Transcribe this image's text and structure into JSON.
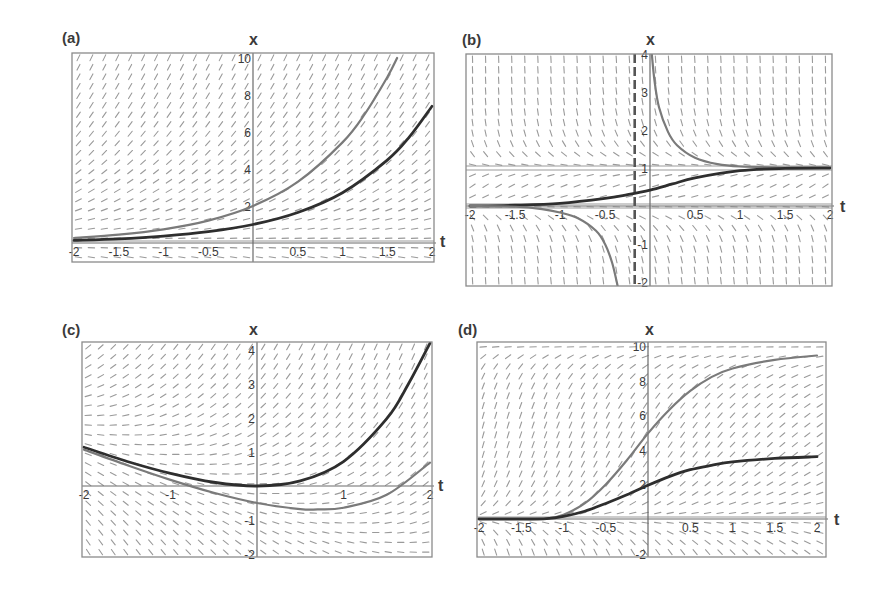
{
  "chart_data": [
    {
      "id": "a",
      "type": "line",
      "title": "(a)",
      "xlabel": "t",
      "ylabel": "x",
      "xlim": [
        -2.02,
        2.02
      ],
      "ylim": [
        -1.05,
        10.2
      ],
      "xticks": [
        -2,
        -1.5,
        -1,
        -0.5,
        0.5,
        1,
        1.5,
        2
      ],
      "xtick_labels": [
        "-2",
        "-1.5",
        "-1",
        "-0.5",
        "0.5",
        "1",
        "1.5",
        "2"
      ],
      "yticks": [
        -2,
        2,
        4,
        6,
        8,
        10
      ],
      "ytick_labels": [
        "-2",
        "2",
        "4",
        "6",
        "8",
        "10"
      ],
      "slope_field": "x",
      "equilibria": [
        0
      ],
      "series": [
        {
          "name": "x = 2e^t",
          "color": "#7a7a7a",
          "width": 2.2,
          "t": [
            -2,
            -1.5,
            -1,
            -0.5,
            0,
            0.5,
            1,
            1.25,
            1.5,
            1.61
          ],
          "x": [
            0.27,
            0.45,
            0.74,
            1.21,
            2.0,
            3.3,
            5.44,
            6.98,
            8.96,
            10.0
          ]
        },
        {
          "name": "x = e^t",
          "color": "#2e2e2e",
          "width": 2.8,
          "t": [
            -2,
            -1.5,
            -1,
            -0.5,
            0,
            0.5,
            1,
            1.5,
            1.75,
            2
          ],
          "x": [
            0.14,
            0.22,
            0.37,
            0.61,
            1.0,
            1.65,
            2.72,
            4.48,
            5.75,
            7.39
          ]
        }
      ],
      "frame": {
        "left": 72,
        "top": 53,
        "right": 434,
        "bottom": 262
      },
      "pixel_map": {
        "t0": 74,
        "t1": 432,
        "x0_px": 243,
        "x_per_unit": 18.5
      }
    },
    {
      "id": "b",
      "type": "line",
      "title": "(b)",
      "xlabel": "t",
      "ylabel": "x",
      "xlim": [
        -2.02,
        2.02
      ],
      "ylim": [
        -2.1,
        4.1
      ],
      "xticks": [
        -2,
        -1.5,
        -1,
        -0.5,
        0.5,
        1,
        1.5,
        2
      ],
      "xtick_labels": [
        "-2",
        "-1.5",
        "-1",
        "-0.5",
        "0.5",
        "1",
        "1.5",
        "2"
      ],
      "yticks": [
        -2,
        -1,
        1,
        2,
        3,
        4
      ],
      "ytick_labels": [
        "-2",
        "-1",
        "1",
        "2",
        "3",
        "4"
      ],
      "slope_field": "logistic_t",
      "equilibria": [
        0,
        1
      ],
      "asymptote_t": -0.17,
      "series": [
        {
          "name": "upper solution (x > 1)",
          "color": "#7a7a7a",
          "width": 2.2,
          "t": [
            0.02,
            0.05,
            0.1,
            0.2,
            0.3,
            0.5,
            0.75,
            1.0,
            1.5,
            2.0
          ],
          "x": [
            4.0,
            3.3,
            2.6,
            1.95,
            1.6,
            1.27,
            1.1,
            1.04,
            1.01,
            1.0
          ]
        },
        {
          "name": "middle solution (0 < x < 1)",
          "color": "#2e2e2e",
          "width": 2.8,
          "t": [
            -2,
            -1.5,
            -1,
            -0.5,
            -0.25,
            0,
            0.25,
            0.5,
            1.0,
            1.5,
            2.0
          ],
          "x": [
            0.0,
            0.02,
            0.07,
            0.2,
            0.3,
            0.42,
            0.58,
            0.74,
            0.93,
            0.99,
            1.0
          ]
        },
        {
          "name": "lower solution (x < 0)",
          "color": "#7a7a7a",
          "width": 2.2,
          "t": [
            -2,
            -1.5,
            -1.2,
            -1.0,
            -0.8,
            -0.6,
            -0.5,
            -0.42,
            -0.36
          ],
          "x": [
            0.0,
            -0.02,
            -0.08,
            -0.17,
            -0.32,
            -0.65,
            -1.0,
            -1.5,
            -2.1
          ]
        }
      ],
      "frame": {
        "left": 466,
        "top": 54,
        "right": 832,
        "bottom": 286
      },
      "pixel_map": {
        "t0": 470,
        "t1": 830,
        "x0_px": 206,
        "x_per_unit": 38
      }
    },
    {
      "id": "c",
      "type": "line",
      "title": "(c)",
      "xlabel": "t",
      "ylabel": "x",
      "xlim": [
        -2.02,
        2.02
      ],
      "ylim": [
        -2.1,
        4.2
      ],
      "xticks": [
        -2,
        -1,
        1,
        2
      ],
      "xtick_labels": [
        "-2",
        "-1",
        "1",
        "2"
      ],
      "yticks": [
        -2,
        -1,
        1,
        2,
        3,
        4
      ],
      "ytick_labels": [
        "-2",
        "-1",
        "1",
        "2",
        "3",
        "4"
      ],
      "slope_field": "x_plus_t",
      "equilibria": [],
      "series": [
        {
          "name": "x = e^t - t - 1",
          "color": "#2e2e2e",
          "width": 2.8,
          "t": [
            -2,
            -1.5,
            -1,
            -0.5,
            0,
            0.5,
            1,
            1.5,
            1.75,
            2
          ],
          "x": [
            1.14,
            0.72,
            0.37,
            0.11,
            0.0,
            0.15,
            0.72,
            1.98,
            3.0,
            4.2
          ]
        },
        {
          "name": "x = 0.5e^t - t - 1",
          "color": "#7a7a7a",
          "width": 2.2,
          "t": [
            -2,
            -1.5,
            -1,
            -0.5,
            0,
            0.5,
            0.7,
            1,
            1.5,
            2
          ],
          "x": [
            1.07,
            0.61,
            0.18,
            -0.2,
            -0.5,
            -0.68,
            -0.69,
            -0.64,
            -0.26,
            0.69
          ]
        }
      ],
      "frame": {
        "left": 82,
        "top": 342,
        "right": 432,
        "bottom": 557
      },
      "pixel_map": {
        "t0": 84,
        "t1": 430,
        "x0_px": 486,
        "x_per_unit": 34
      }
    },
    {
      "id": "d",
      "type": "line",
      "title": "(d)",
      "xlabel": "t",
      "ylabel": "x",
      "xlim": [
        -2.02,
        2.02
      ],
      "ylim": [
        -2.2,
        10.2
      ],
      "xticks": [
        -2,
        -1.5,
        -1,
        -0.5,
        0.5,
        1,
        1.5,
        2
      ],
      "xtick_labels": [
        "-2",
        "-1.5",
        "-1",
        "-0.5",
        "0.5",
        "1",
        "1.5",
        "2"
      ],
      "yticks": [
        -2,
        2,
        4,
        6,
        8,
        10
      ],
      "ytick_labels": [
        "-2",
        "2",
        "4",
        "6",
        "8",
        "10"
      ],
      "slope_field": "growth_d",
      "equilibria": [
        0
      ],
      "series": [
        {
          "name": "upper solution",
          "color": "#7a7a7a",
          "width": 2.2,
          "t": [
            -2,
            -1.5,
            -1.2,
            -1.0,
            -0.75,
            -0.5,
            -0.25,
            0,
            0.25,
            0.5,
            0.75,
            1.0,
            1.5,
            2.0
          ],
          "x": [
            0.0,
            0.0,
            0.02,
            0.25,
            0.9,
            2.0,
            3.4,
            4.95,
            6.3,
            7.4,
            8.2,
            8.7,
            9.2,
            9.45
          ]
        },
        {
          "name": "lower solution",
          "color": "#2e2e2e",
          "width": 2.8,
          "t": [
            -2,
            -1.5,
            -1.2,
            -1.0,
            -0.75,
            -0.5,
            -0.25,
            0,
            0.25,
            0.5,
            0.75,
            1.0,
            1.5,
            2.0
          ],
          "x": [
            0.0,
            0.0,
            0.02,
            0.15,
            0.45,
            0.9,
            1.4,
            1.95,
            2.45,
            2.85,
            3.1,
            3.3,
            3.5,
            3.6
          ]
        }
      ],
      "frame": {
        "left": 477,
        "top": 342,
        "right": 826,
        "bottom": 557
      },
      "pixel_map": {
        "t0": 479,
        "t1": 817,
        "x0_px": 519,
        "x_per_unit": 17.3
      }
    }
  ],
  "labels": {
    "a": {
      "panel": "(a)",
      "x_axis": "x",
      "t_axis": "t"
    },
    "b": {
      "panel": "(b)",
      "x_axis": "x",
      "t_axis": "t"
    },
    "c": {
      "panel": "(c)",
      "x_axis": "x",
      "t_axis": "t"
    },
    "d": {
      "panel": "(d)",
      "x_axis": "x",
      "t_axis": "t"
    }
  },
  "colors": {
    "frame": "#8a8a8a",
    "axis": "#6a6a6a",
    "field": "#9a9a9a",
    "text": "#3a3a3a"
  }
}
